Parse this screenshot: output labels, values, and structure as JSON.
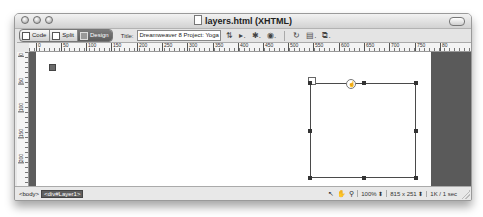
{
  "window": {
    "title": "layers.html (XHTML)"
  },
  "toolbar": {
    "views": [
      {
        "label": "Code",
        "active": false
      },
      {
        "label": "Split",
        "active": false
      },
      {
        "label": "Design",
        "active": true
      }
    ],
    "title_label": "Title:",
    "title_value": "Dreamweaver 8 Project: Yoga S",
    "icons": [
      "file-management-icon",
      "preview-icon",
      "debug-icon",
      "visual-aids-icon",
      "refresh-icon",
      "view-options-icon",
      "validate-icon"
    ]
  },
  "ruler": {
    "horizontal_labels": [
      "0",
      "50",
      "100",
      "150",
      "200",
      "250",
      "300",
      "350",
      "400",
      "450",
      "500",
      "550",
      "600",
      "650",
      "700",
      "750",
      "80"
    ],
    "vertical_labels": [
      "0",
      "50",
      "100",
      "150",
      "200"
    ]
  },
  "status": {
    "tags": [
      "<body>",
      "<div#Layer1>"
    ],
    "zoom": "100%",
    "window_size": "815 x 251",
    "download": "1K / 1 sec"
  },
  "colors": {
    "canvas_margin": "#5a5a5a",
    "layer_border": "#4a4a4a",
    "active_view": "#6b6b6b"
  }
}
